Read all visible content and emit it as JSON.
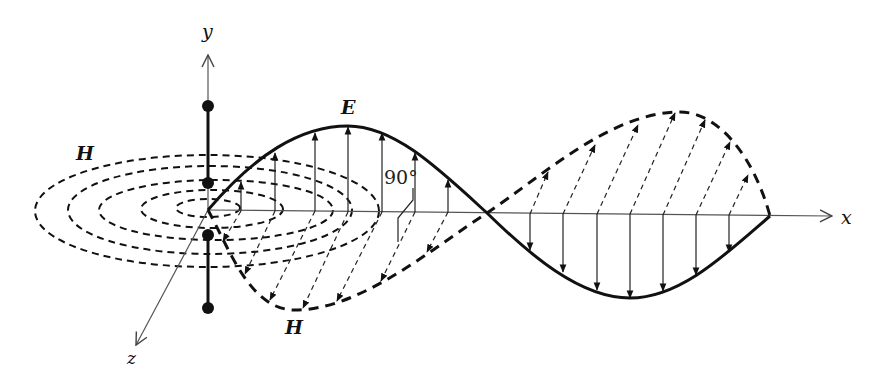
{
  "figure": {
    "axes": {
      "x_label": "x",
      "y_label": "y",
      "z_label": "z"
    },
    "labels": {
      "electric_field": "E",
      "magnetic_field_top": "H",
      "magnetic_field_bottom": "H",
      "angle": "90°"
    },
    "colors": {
      "line": "#111111",
      "axis": "#555555",
      "background": "#ffffff"
    },
    "dipole": {
      "dots": 4,
      "description": "vertical dipole antenna along y-axis at origin"
    },
    "wave": {
      "E_field": "solid sinusoid in x-y plane, upward arrows in first half-cycle, downward arrows in second half-cycle",
      "H_field": "dashed sinusoid in x-z plane, perpendicular (90°) to E",
      "E_arrow_count_up": 7,
      "E_arrow_count_down": 8,
      "H_arrow_count_first": 8,
      "H_arrow_count_second": 7,
      "H_field_rings": 5
    }
  }
}
